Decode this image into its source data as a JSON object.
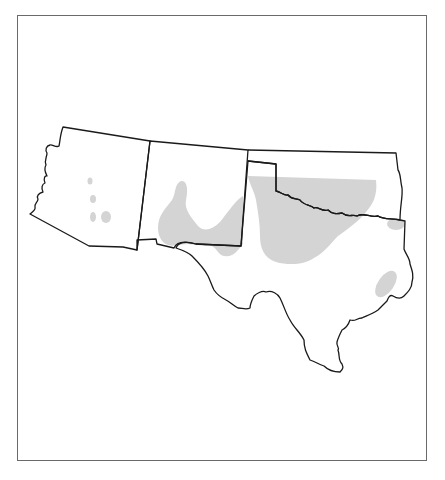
{
  "map": {
    "type": "distribution-map",
    "regions": [
      "Arizona",
      "New Mexico",
      "Oklahoma",
      "Texas"
    ],
    "colors": {
      "border": "#1a1a1a",
      "frame": "#6a6a6a",
      "range_fill": "#d4d4d4",
      "land": "#ffffff"
    },
    "legend": {
      "range": "shaded areas indicate distribution range"
    }
  },
  "caption": {
    "text": ""
  }
}
